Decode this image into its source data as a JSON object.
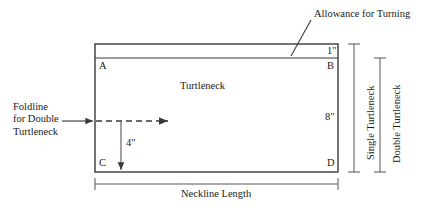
{
  "diagram": {
    "piece_label": "Turtleneck",
    "annotations": {
      "allowance": "Allowance for Turning",
      "foldline_line1": "Foldline",
      "foldline_line2": "for Double",
      "foldline_line3": "Turtleneck",
      "neckline_length": "Neckline Length",
      "single_turtleneck": "Single Turtleneck",
      "double_turtleneck": "Double Turtleneck"
    },
    "vertices": {
      "a": "A",
      "b": "B",
      "c": "C",
      "d": "D"
    },
    "measurements": {
      "allowance_height": "1\"",
      "body_height": "8\"",
      "foldline_offset": "4\""
    },
    "colors": {
      "stroke": "#3a3a3a",
      "text": "#1a1a1a",
      "background": "#ffffff",
      "dimension": "#555555"
    },
    "geometry": {
      "rect_left": 95,
      "rect_right": 338,
      "rect_top": 44,
      "rect_inner_top": 58,
      "rect_bottom": 172,
      "foldline_y": 121,
      "foldline_tick_x": 121
    }
  }
}
